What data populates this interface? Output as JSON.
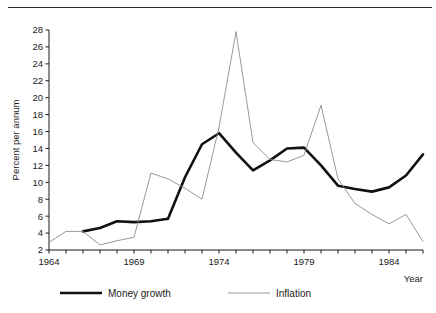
{
  "figure": {
    "title": "",
    "top_rule": "horizontal-rule"
  },
  "axes": {
    "y_axis_title": "Percent per annum",
    "x_axis_title": "Year",
    "y_ticks": [
      "2",
      "4",
      "6",
      "8",
      "10",
      "12",
      "14",
      "16",
      "18",
      "20",
      "22",
      "24",
      "26",
      "28"
    ],
    "x_ticks": [
      "1964",
      "1969",
      "1974",
      "1979",
      "1984"
    ]
  },
  "legend": {
    "items": [
      {
        "label": "Money growth",
        "color": "#111111",
        "width": 2.6
      },
      {
        "label": "Inflation",
        "color": "#8c8c8c",
        "width": 0.9
      }
    ]
  },
  "chart_data": {
    "type": "line",
    "title": "",
    "xlabel": "Year",
    "ylabel": "Percent per annum",
    "xlim": [
      1964,
      1986
    ],
    "ylim": [
      2,
      28
    ],
    "ytick_step": 2,
    "xtick_step": 1,
    "xtick_labeled": [
      1964,
      1969,
      1974,
      1979,
      1984
    ],
    "grid": false,
    "legend_position": "below",
    "series": [
      {
        "name": "Money growth",
        "color": "#111111",
        "linewidth": 2.6,
        "x": [
          1966,
          1967,
          1968,
          1969,
          1970,
          1971,
          1972,
          1973,
          1974,
          1975,
          1976,
          1977,
          1978,
          1979,
          1980,
          1981,
          1982,
          1983,
          1984,
          1985,
          1986
        ],
        "values": [
          4.2,
          4.6,
          5.4,
          5.3,
          5.4,
          5.7,
          10.6,
          14.5,
          15.8,
          13.5,
          11.4,
          12.6,
          14.0,
          14.1,
          12.0,
          9.6,
          9.2,
          8.9,
          9.4,
          10.8,
          13.3
        ]
      },
      {
        "name": "Inflation",
        "color": "#8c8c8c",
        "linewidth": 0.9,
        "x": [
          1964,
          1965,
          1966,
          1967,
          1968,
          1969,
          1970,
          1971,
          1972,
          1973,
          1974,
          1975,
          1976,
          1977,
          1978,
          1979,
          1980,
          1981,
          1982,
          1983,
          1984,
          1985,
          1986
        ],
        "values": [
          2.9,
          4.2,
          4.2,
          2.6,
          3.1,
          3.5,
          11.1,
          10.4,
          9.3,
          8.0,
          16.5,
          27.8,
          14.7,
          12.7,
          12.4,
          13.2,
          19.1,
          10.4,
          7.5,
          6.2,
          5.1,
          6.2,
          3.0
        ]
      }
    ]
  }
}
